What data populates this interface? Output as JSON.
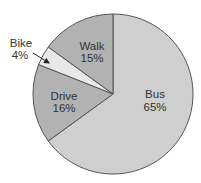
{
  "chart_data": {
    "type": "pie",
    "title": "",
    "title_note": "title cropped at top edge; only descenders visible",
    "slices": [
      {
        "label": "Bus",
        "value": 65,
        "display": "65%",
        "color": "#cfcfcf"
      },
      {
        "label": "Drive",
        "value": 16,
        "display": "16%",
        "color": "#b2b2b2"
      },
      {
        "label": "Bike",
        "value": 4,
        "display": "4%",
        "color": "#e8e8e8"
      },
      {
        "label": "Walk",
        "value": 15,
        "display": "15%",
        "color": "#b2b2b2"
      }
    ],
    "start_angle_deg": 0,
    "direction": "clockwise",
    "legend": "none (labels placed on slices; Bike label outside with arrow)"
  },
  "labels": {
    "bus": {
      "name": "Bus",
      "pct": "65%"
    },
    "drive": {
      "name": "Drive",
      "pct": "16%"
    },
    "bike": {
      "name": "Bike",
      "pct": "4%"
    },
    "walk": {
      "name": "Walk",
      "pct": "15%"
    }
  },
  "colors": {
    "outline": "#555555",
    "text": "#333333"
  }
}
